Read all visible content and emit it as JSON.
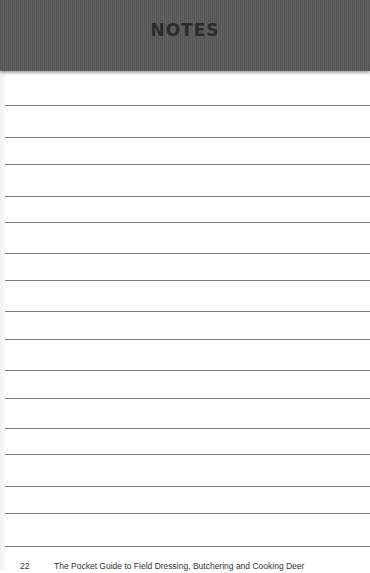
{
  "header": {
    "title": "NOTES"
  },
  "page": {
    "rule_positions": [
      105,
      137,
      164,
      196,
      222,
      253,
      280,
      311,
      339,
      370,
      398,
      428,
      454,
      486,
      513,
      546
    ],
    "colors": {
      "header": "#5a5a5a",
      "title": "#2b2b2b",
      "rule": "#7d7d7d",
      "paper": "#ffffff"
    }
  },
  "footer": {
    "page_number": "22",
    "book_title": "The Pocket Guide to Field Dressing, Butchering and Cooking Deer"
  }
}
